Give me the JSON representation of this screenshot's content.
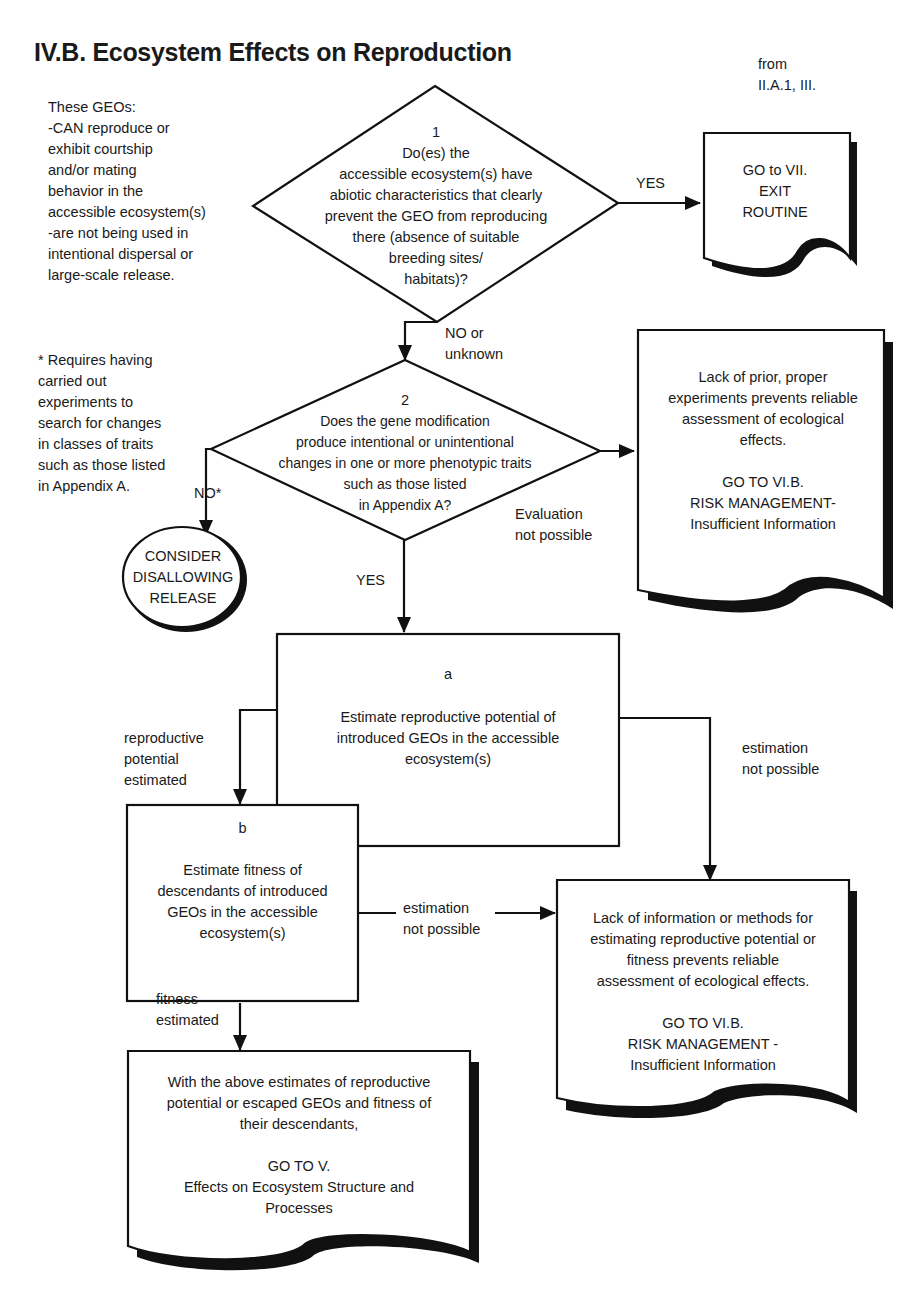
{
  "title": "IV.B. Ecosystem Effects on Reproduction",
  "from_note": "from\nII.A.1, III.",
  "preconditions": "These GEOs:\n-CAN reproduce or\n  exhibit courtship\n  and/or mating\n  behavior in the\n  accessible ecosystem(s)\n-are not being used in\n  intentional dispersal or\n  large-scale release.",
  "footnote": "* Requires having\ncarried out\nexperiments to\nsearch for changes\nin classes of traits\nsuch as those listed\nin Appendix A.",
  "decision1": {
    "number": "1",
    "text": "Do(es) the\naccessible ecosystem(s) have\nabiotic characteristics that clearly\nprevent the GEO from reproducing\nthere (absence of suitable\nbreeding sites/\nhabitats)?",
    "yes_label": "YES",
    "no_label": "NO or\nunknown"
  },
  "exit_box": {
    "text": "GO to VII.\nEXIT\nROUTINE"
  },
  "decision2": {
    "number": "2",
    "text": "Does the gene modification\nproduce intentional or unintentional\nchanges in one or more phenotypic traits\nsuch as those listed\nin Appendix A?",
    "yes_label": "YES",
    "no_label": "NO*",
    "eval_label": "Evaluation\nnot possible"
  },
  "disallow_circle": {
    "text": "CONSIDER\nDISALLOWING\nRELEASE"
  },
  "insufficient_box_1": {
    "text": "Lack of prior, proper\nexperiments prevents reliable\nassessment of ecological\neffects.\n\nGO TO VI.B.\nRISK MANAGEMENT-\nInsufficient Information"
  },
  "step_a": {
    "letter": "a",
    "text": "Estimate reproductive potential of\nintroduced GEOs in the accessible\necosystem(s)"
  },
  "step_b": {
    "letter": "b",
    "text": "Estimate fitness of\ndescendants of introduced\nGEOs in the accessible\necosystem(s)"
  },
  "labels": {
    "repro_estimated": "reproductive\npotential\nestimated",
    "a_not_possible": "estimation\nnot possible",
    "b_not_possible": "estimation\nnot possible",
    "fitness_estimated": "fitness\nestimated"
  },
  "insufficient_box_2": {
    "text": "Lack of information or methods for\nestimating reproductive potential or\nfitness prevents reliable\nassessment of ecological effects.\n\nGO TO VI.B.\nRISK MANAGEMENT -\nInsufficient Information"
  },
  "goto_v_box": {
    "text": "With the above estimates of reproductive\npotential or escaped GEOs and fitness of\ntheir descendants,\n\nGO TO V.\nEffects on Ecosystem Structure and\nProcesses"
  }
}
